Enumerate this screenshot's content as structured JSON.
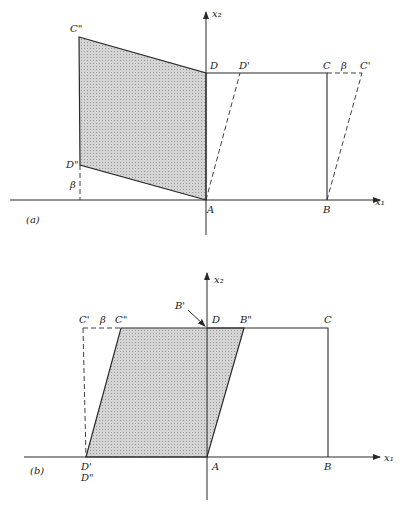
{
  "panels": [
    {
      "id": "a",
      "caption": "(a)",
      "axis_x_label": "x₁",
      "axis_y_label": "x₂",
      "labels": {
        "A": "A",
        "B": "B",
        "C": "C",
        "D": "D",
        "C_prime": "C'",
        "D_prime": "D'",
        "C_dprime": "C\"",
        "D_dprime": "D\"",
        "beta_top": "β",
        "beta_left": "β"
      },
      "description": "Unit square ABCD sheared by β (dashed ABC'D') and rotated/shaded region AD''C''D"
    },
    {
      "id": "b",
      "caption": "(b)",
      "axis_x_label": "x₁",
      "axis_y_label": "x₂",
      "labels": {
        "A": "A",
        "B": "B",
        "C": "C",
        "D": "D",
        "C_prime": "C'",
        "C_dprime": "C\"",
        "B_prime": "B'",
        "B_dprime": "B\"",
        "D_prime": "D'",
        "D_dprime": "D\"",
        "beta_top": "β"
      },
      "description": "Square ABCD with sheared shaded parallelogram D'AB''C''"
    }
  ],
  "colors": {
    "shade": "#c9c9c9",
    "line": "#2a2a2a"
  }
}
